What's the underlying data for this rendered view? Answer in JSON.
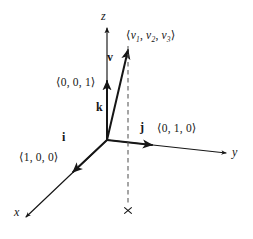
{
  "figure": {
    "background_color": "#ffffff",
    "ink_color": "#161616",
    "width": 253,
    "height": 239
  },
  "axes": [
    {
      "id": "z",
      "label": "z",
      "direction": "up"
    },
    {
      "id": "y",
      "label": "y",
      "direction": "right-down"
    },
    {
      "id": "x",
      "label": "x",
      "direction": "left-down"
    }
  ],
  "origin": {
    "label": "O",
    "x": 107,
    "y": 140
  },
  "vectors": [
    {
      "id": "k",
      "name": "k",
      "components_text": "⟨0, 0, 1⟩",
      "components": [
        0,
        0,
        1
      ],
      "along_axis": "z"
    },
    {
      "id": "j",
      "name": "j",
      "components_text": "⟨0, 1, 0⟩",
      "components": [
        0,
        1,
        0
      ],
      "along_axis": "y"
    },
    {
      "id": "i",
      "name": "i",
      "components_text": "⟨1, 0, 0⟩",
      "components": [
        1,
        0,
        0
      ],
      "along_axis": "x"
    },
    {
      "id": "v",
      "name": "v",
      "components_text": "⟨v1, v2, v3⟩",
      "open_bracket": "⟨",
      "close_bracket": "⟩",
      "comma": ",",
      "component_base": "v",
      "component_subscripts": [
        "1",
        "2",
        "3"
      ],
      "along_axis": null
    }
  ],
  "projection": {
    "style": "dashed",
    "marker": "×",
    "description": "dashed vertical drop line from the tip of v to the xy-plane, ending at a small cross marker"
  }
}
